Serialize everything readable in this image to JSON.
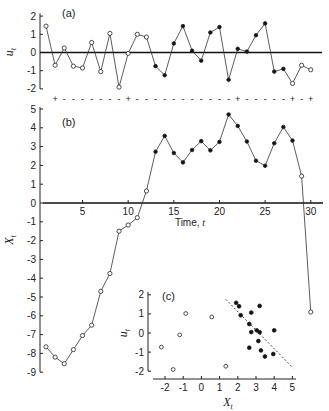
{
  "chart_data": [
    {
      "id": "a",
      "type": "line",
      "panel_label": "(a)",
      "xlabel": "",
      "ylabel": "u_t",
      "ylim": [
        -2,
        2
      ],
      "yticks": [
        2,
        1,
        0,
        -1,
        -2
      ],
      "x": [
        1,
        2,
        3,
        4,
        5,
        6,
        7,
        8,
        9,
        10,
        11,
        12,
        13,
        14,
        15,
        16,
        17,
        18,
        19,
        20,
        21,
        22,
        23,
        24,
        25,
        26,
        27,
        28,
        29,
        30
      ],
      "values": [
        1.45,
        -0.7,
        0.25,
        -0.75,
        -0.85,
        0.55,
        -1.05,
        1.05,
        -1.9,
        -0.05,
        1.0,
        0.85,
        -0.75,
        -1.25,
        0.5,
        1.45,
        0.1,
        -0.45,
        1.1,
        1.4,
        -1.5,
        0.2,
        0.05,
        0.95,
        1.6,
        -1.05,
        -0.9,
        -1.7,
        -0.7,
        -0.95
      ],
      "filled": [
        false,
        false,
        false,
        false,
        false,
        false,
        false,
        false,
        false,
        false,
        false,
        false,
        true,
        true,
        true,
        true,
        true,
        true,
        true,
        true,
        true,
        true,
        true,
        true,
        true,
        true,
        true,
        false,
        false,
        false
      ],
      "zero_line": true,
      "sign_row": {
        "t": [
          2,
          3,
          4,
          5,
          6,
          7,
          8,
          9,
          10,
          11,
          12,
          13,
          14,
          15,
          16,
          17,
          18,
          19,
          20,
          21,
          22,
          23,
          24,
          25,
          26,
          27,
          28,
          29,
          30
        ],
        "signs": [
          "+",
          "-",
          "-",
          "-",
          "-",
          "-",
          "-",
          "-",
          "+",
          "-",
          "-",
          "-",
          "-",
          "-",
          "-",
          "-",
          "-",
          "-",
          "-",
          "-",
          "+",
          "-",
          "-",
          "-",
          "-",
          "-",
          "+",
          "-",
          "+"
        ]
      }
    },
    {
      "id": "b",
      "type": "line",
      "panel_label": "(b)",
      "xlabel": "Time, t",
      "ylabel": "X_t",
      "ylim": [
        -9,
        5
      ],
      "yticks": [
        5,
        4,
        3,
        2,
        1,
        0,
        -1,
        -2,
        -3,
        -4,
        -5,
        -6,
        -7,
        -8,
        -9
      ],
      "xticks": [
        5,
        10,
        15,
        20,
        25,
        30
      ],
      "x": [
        1,
        2,
        3,
        4,
        5,
        6,
        7,
        8,
        9,
        10,
        11,
        12,
        13,
        14,
        15,
        16,
        17,
        18,
        19,
        20,
        21,
        22,
        23,
        24,
        25,
        26,
        27,
        28,
        29,
        30
      ],
      "values": [
        -7.65,
        -8.2,
        -8.55,
        -7.8,
        -7.05,
        -6.5,
        -4.7,
        -3.75,
        -1.5,
        -1.17,
        -0.78,
        0.64,
        2.73,
        3.57,
        2.66,
        2.16,
        2.82,
        3.29,
        2.8,
        3.25,
        4.71,
        4.1,
        3.27,
        2.25,
        1.98,
        3.18,
        4.04,
        3.32,
        1.43,
        -5.8
      ],
      "filled": [
        false,
        false,
        false,
        false,
        false,
        false,
        false,
        false,
        false,
        false,
        false,
        false,
        true,
        true,
        true,
        true,
        true,
        true,
        true,
        true,
        true,
        true,
        true,
        true,
        true,
        true,
        true,
        true,
        false,
        false
      ]
    },
    {
      "id": "c",
      "type": "scatter",
      "panel_label": "(c)",
      "xlabel": "X_t",
      "ylabel": "u_t",
      "xlim": [
        -2.5,
        5.2
      ],
      "ylim": [
        -2,
        2
      ],
      "xticks": [
        -2,
        -1,
        0,
        1,
        2,
        3,
        4,
        5
      ],
      "yticks": [
        2,
        1,
        0,
        -1,
        -2
      ],
      "series": [
        {
          "name": "open",
          "filled": false,
          "points": [
            [
              -2.2,
              -0.74
            ],
            [
              -1.55,
              -1.91
            ],
            [
              -1.19,
              -0.1
            ],
            [
              -0.86,
              1.02
            ],
            [
              0.57,
              0.84
            ],
            [
              1.34,
              -1.74
            ]
          ]
        },
        {
          "name": "filled",
          "filled": true,
          "points": [
            [
              1.91,
              1.58
            ],
            [
              2.07,
              1.4
            ],
            [
              2.16,
              0.93
            ],
            [
              2.74,
              1.07
            ],
            [
              2.63,
              0.47
            ],
            [
              2.74,
              0.05
            ],
            [
              2.63,
              -0.77
            ],
            [
              3.04,
              0.14
            ],
            [
              3.2,
              0.04
            ],
            [
              3.2,
              1.42
            ],
            [
              3.13,
              -0.42
            ],
            [
              3.27,
              -0.91
            ],
            [
              3.49,
              -1.23
            ],
            [
              4.0,
              0.14
            ],
            [
              3.95,
              -1.1
            ]
          ]
        }
      ],
      "dashed_line": [
        [
          1.34,
          1.76
        ],
        [
          5.05,
          -1.84
        ]
      ]
    }
  ]
}
